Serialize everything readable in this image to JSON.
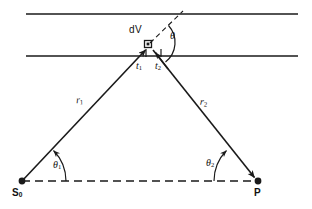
{
  "figure": {
    "background_color": "#ffffff",
    "stroke_color": "#1a1a1a",
    "labels": {
      "volume_element": "dV",
      "theta": "θ",
      "t1": "t",
      "t1_sub": "1",
      "t2": "t",
      "t2_sub": "2",
      "r1": "r",
      "r1_sub": "1",
      "r2": "r",
      "r2_sub": "2",
      "theta1": "θ",
      "theta1_sub": "1",
      "theta2": "θ",
      "theta2_sub": "2",
      "source_point": "S",
      "source_point_sub": "0",
      "detector_point": "P"
    }
  },
  "geometry": {
    "slab": {
      "top_line": {
        "x1": 26,
        "y1": 14,
        "x2": 298,
        "y2": 14
      },
      "bottom_line": {
        "x1": 26,
        "y1": 56,
        "x2": 298,
        "y2": 56
      }
    },
    "volume_element_square": {
      "x": 144,
      "y": 41,
      "size": 7
    },
    "dashed_normal_ray": {
      "x1": 150,
      "y1": 44,
      "x2": 182,
      "y2": 12
    },
    "ray_in": {
      "x1": 22,
      "y1": 181,
      "x2": 148,
      "y2": 48
    },
    "ray_out": {
      "x1": 152,
      "y1": 48,
      "x2": 258,
      "y2": 181
    },
    "baseline_dashed": {
      "x1": 22,
      "y1": 181,
      "x2": 258,
      "y2": 181
    },
    "source_dot": {
      "cx": 22,
      "cy": 181,
      "r": 3
    },
    "detector_dot": {
      "cx": 258,
      "cy": 181,
      "r": 3
    },
    "tick_t1": {
      "x1": 146,
      "y1": 50,
      "x2": 146,
      "y2": 58
    },
    "tick_t2": {
      "x1": 161,
      "y1": 50,
      "x2": 161,
      "y2": 58
    },
    "angle_arc_theta1_radius": 40,
    "angle_arc_theta2_radius": 40,
    "angle_arc_theta_radius": 24
  }
}
